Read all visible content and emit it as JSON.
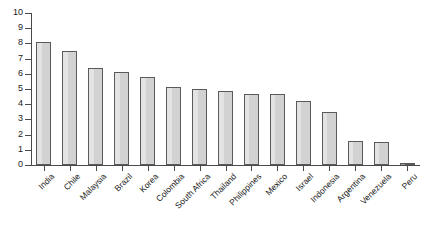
{
  "chart_data": {
    "type": "bar",
    "title": "",
    "subtitle": "",
    "xlabel": "",
    "ylabel": "",
    "ylim": [
      0,
      10
    ],
    "yticks": [
      0,
      1,
      2,
      3,
      4,
      5,
      6,
      7,
      8,
      9,
      10
    ],
    "ytick_labels": [
      "0",
      "1",
      "2",
      "3",
      "4",
      "5",
      "6",
      "7",
      "8",
      "9",
      "10"
    ],
    "grid": false,
    "legend": null,
    "legend_position": "none",
    "bar_fill_color": "#d2d2d2",
    "bar_edge_color": "#5a5a5a",
    "axis_color": "#4a4a4a",
    "background_color": "#ffffff",
    "categories": [
      "India",
      "Chile",
      "Malaysia",
      "Brazil",
      "Korea",
      "Colombia",
      "South Africa",
      "Thailand",
      "Philippines",
      "Mexico",
      "Israel",
      "Indonesia",
      "Argentina",
      "Venezuela",
      "Peru"
    ],
    "values": [
      8.1,
      7.5,
      6.4,
      6.1,
      5.8,
      5.1,
      5.0,
      4.9,
      4.7,
      4.7,
      4.2,
      3.5,
      1.6,
      1.5,
      0.15
    ]
  }
}
